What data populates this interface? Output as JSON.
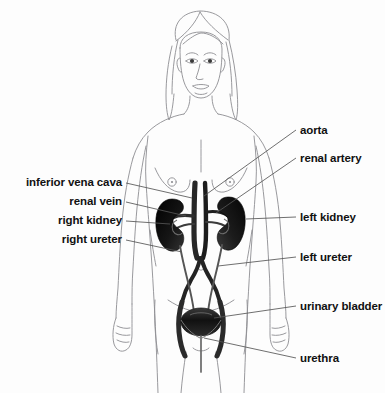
{
  "figure": {
    "background_color": "#fdfdfd",
    "sketch_line_color": "#8d8d92",
    "organ_color": "#1a1a1a",
    "vessel_color": "#2a2a2a",
    "leader_line_color": "#555555",
    "label_color": "#111111"
  },
  "labels_left": [
    {
      "text": "inferior vena cava",
      "x": 22,
      "y": 176,
      "right_edge": 122,
      "leader_to_x": 192,
      "leader_to_y": 196
    },
    {
      "text": "renal vein",
      "x": 22,
      "y": 195,
      "right_edge": 122,
      "leader_to_x": 186,
      "leader_to_y": 214
    },
    {
      "text": "right kidney",
      "x": 22,
      "y": 214,
      "right_edge": 122,
      "leader_to_x": 172,
      "leader_to_y": 222
    },
    {
      "text": "right ureter",
      "x": 22,
      "y": 233,
      "right_edge": 122,
      "leader_to_x": 183,
      "leader_to_y": 250
    }
  ],
  "labels_right": [
    {
      "text": "aorta",
      "x": 300,
      "y": 124,
      "leader_to_x": 200,
      "leader_to_y": 196
    },
    {
      "text": "renal artery",
      "x": 300,
      "y": 152,
      "leader_to_x": 214,
      "leader_to_y": 212
    },
    {
      "text": "left kidney",
      "x": 300,
      "y": 211,
      "leader_to_x": 228,
      "leader_to_y": 218
    },
    {
      "text": "left ureter",
      "x": 300,
      "y": 251,
      "leader_to_x": 222,
      "leader_to_y": 262
    },
    {
      "text": "urinary bladder",
      "x": 300,
      "y": 300,
      "leader_to_x": 212,
      "leader_to_y": 318
    },
    {
      "text": "urethra",
      "x": 300,
      "y": 352,
      "leader_to_x": 205,
      "leader_to_y": 336
    }
  ],
  "anatomy_parts": [
    "head",
    "hair",
    "face",
    "eyes",
    "nose",
    "mouth",
    "ears",
    "neck",
    "shoulders",
    "arms",
    "hands",
    "breasts",
    "navel",
    "torso",
    "hips",
    "thighs",
    "aorta",
    "inferior vena cava",
    "renal artery",
    "renal vein",
    "right kidney",
    "left kidney",
    "right ureter",
    "left ureter",
    "iliac arteries",
    "urinary bladder",
    "urethra"
  ]
}
